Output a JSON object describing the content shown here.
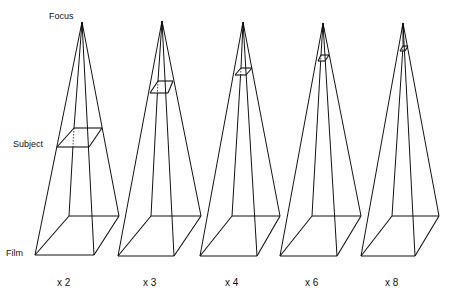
{
  "labels": {
    "focus": "Focus",
    "subject": "Subject",
    "film": "Film"
  },
  "pyramids": [
    {
      "magnification": "x 2",
      "apex": [
        82,
        22
      ],
      "base": {
        "fl": [
          35,
          255
        ],
        "fr": [
          94,
          255
        ],
        "br": [
          119,
          216
        ],
        "bl": [
          69,
          216
        ]
      },
      "subject": {
        "fl": [
          57,
          147
        ],
        "fr": [
          89,
          147
        ],
        "br": [
          102,
          128
        ],
        "bl": [
          74,
          128
        ]
      },
      "label_pos": [
        57,
        286
      ]
    },
    {
      "magnification": "x 3",
      "apex": [
        162,
        21
      ],
      "base": {
        "fl": [
          118,
          256
        ],
        "fr": [
          174,
          256
        ],
        "br": [
          201,
          216
        ],
        "bl": [
          151,
          216
        ]
      },
      "subject": {
        "fl": [
          150,
          93
        ],
        "fr": [
          168,
          93
        ],
        "br": [
          173,
          81
        ],
        "bl": [
          158,
          81
        ]
      },
      "label_pos": [
        143,
        286
      ]
    },
    {
      "magnification": "x 4",
      "apex": [
        243,
        22
      ],
      "base": {
        "fl": [
          200,
          256
        ],
        "fr": [
          257,
          256
        ],
        "br": [
          280,
          216
        ],
        "bl": [
          232,
          216
        ]
      },
      "subject": {
        "fl": [
          235,
          75
        ],
        "fr": [
          246,
          75
        ],
        "br": [
          252,
          68
        ],
        "bl": [
          241,
          68
        ]
      },
      "label_pos": [
        225,
        286
      ]
    },
    {
      "magnification": "x 6",
      "apex": [
        323,
        23
      ],
      "base": {
        "fl": [
          280,
          256
        ],
        "fr": [
          337,
          256
        ],
        "br": [
          361,
          216
        ],
        "bl": [
          312,
          216
        ]
      },
      "subject": {
        "fl": [
          318,
          61
        ],
        "fr": [
          325,
          61
        ],
        "br": [
          329,
          55
        ],
        "bl": [
          321,
          55
        ]
      },
      "label_pos": [
        305,
        286
      ]
    },
    {
      "magnification": "x 8",
      "apex": [
        403,
        23
      ],
      "base": {
        "fl": [
          361,
          256
        ],
        "fr": [
          415,
          256
        ],
        "br": [
          439,
          216
        ],
        "bl": [
          392,
          216
        ]
      },
      "subject": {
        "fl": [
          400,
          51
        ],
        "fr": [
          405,
          51
        ],
        "br": [
          408,
          46
        ],
        "bl": [
          403,
          46
        ]
      },
      "label_pos": [
        385,
        286
      ]
    }
  ],
  "colors": {
    "ink": "#111111",
    "background": "#ffffff"
  }
}
